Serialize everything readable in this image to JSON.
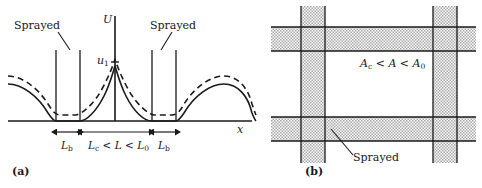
{
  "figure": {
    "caption_a": "(a)",
    "caption_b": "(b)"
  },
  "panel_a": {
    "name": "displacement-profile-plot",
    "axis_y_label": "U",
    "axis_x_label": "x",
    "tick_label_u1": "u",
    "tick_label_u1_sub": "1",
    "annotation_left": "Sprayed",
    "annotation_right": "Sprayed",
    "dim_left": {
      "base": "L",
      "sub": "b"
    },
    "dim_right": {
      "base": "L",
      "sub": "b"
    },
    "dim_center": {
      "term1_base": "L",
      "term1_sub": "c",
      "rel1": " < ",
      "term2_base": "L",
      "term2_sub": "",
      "rel2": " < ",
      "term3_base": "L",
      "term3_sub": "0"
    },
    "curves": {
      "solid_name": "solid-displacement-curve",
      "dashed_name": "dashed-displacement-curve"
    }
  },
  "panel_b": {
    "name": "sprayed-grid-plan",
    "area_relation": {
      "term1_base": "A",
      "term1_sub": "c",
      "rel1": " < ",
      "term2_base": "A",
      "term2_sub": "",
      "rel2": " < ",
      "term3_base": "A",
      "term3_sub": "0"
    },
    "annotation_sprayed": "Sprayed"
  },
  "colors": {
    "ink": "#1a1a1a",
    "band_fill": "#c9c9c9",
    "band_stroke": "#1a1a1a"
  }
}
